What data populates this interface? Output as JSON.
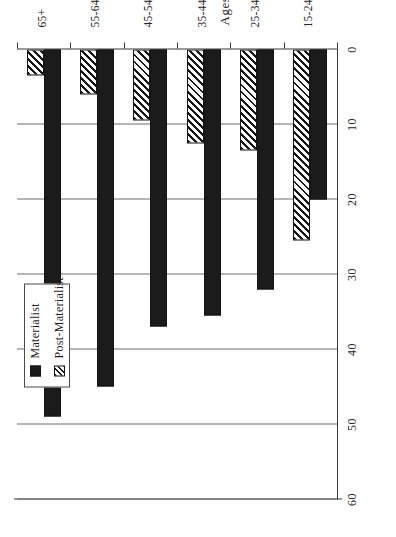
{
  "chart_data": {
    "type": "bar",
    "orientation": "horizontal",
    "title": "",
    "xlabel": "Ages",
    "ylabel": "",
    "ylim": [
      0,
      60
    ],
    "grid": true,
    "legend_position": "upper-left",
    "categories": [
      "65+",
      "55-64",
      "45-54",
      "35-44",
      "25-34",
      "15-24"
    ],
    "category_sublabels": [
      "",
      "",
      "",
      "",
      "",
      "(Postwar generation)"
    ],
    "tick_labels": [
      "0",
      "10",
      "20",
      "30",
      "40",
      "50",
      "60"
    ],
    "tick_values": [
      0,
      10,
      20,
      30,
      40,
      50,
      60
    ],
    "series": [
      {
        "name": "Materialist",
        "pattern": "solid",
        "values": [
          49,
          45,
          37,
          35.5,
          32,
          20
        ]
      },
      {
        "name": "Post-Materialist",
        "pattern": "hatched",
        "values": [
          3.5,
          6,
          9.5,
          12.5,
          13.5,
          25.5
        ]
      }
    ]
  },
  "legend": {
    "entries": [
      {
        "label": "Materialist",
        "swatch": "solid-black-swatch"
      },
      {
        "label": "Post-Materialist",
        "swatch": "hatched-swatch"
      }
    ]
  },
  "axis": {
    "category_axis_title": "Ages",
    "postwar_note_line1": "(Postwar",
    "postwar_note_line2": "generation)"
  }
}
